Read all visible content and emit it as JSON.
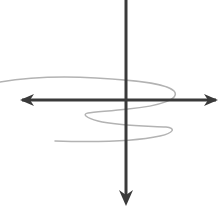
{
  "figure": {
    "kind": "coordinate-axes-with-spiral-sketch",
    "title": "",
    "caption": "",
    "background_color": "#ffffff",
    "width": 224,
    "height": 209
  },
  "axes": {
    "color": "#3a3a3a",
    "stroke_width": 3,
    "origin": {
      "x": 126,
      "y": 100
    },
    "horizontal": {
      "name": "horizontal-axis",
      "label": "",
      "x_start": 22,
      "x_end": 216,
      "y": 100,
      "arrow_left": true,
      "arrow_right": true,
      "left_arrow_tip": {
        "x": 20,
        "y": 100
      },
      "right_arrow_tip": {
        "x": 218,
        "y": 100
      }
    },
    "vertical": {
      "name": "vertical-axis",
      "label": "",
      "x": 126,
      "y_start": 0,
      "y_end": 196,
      "arrow_up": false,
      "arrow_down": true,
      "top_clipped": true,
      "bottom_arrow_tip": {
        "x": 126,
        "y": 206
      }
    }
  },
  "curve": {
    "name": "spiral-curve",
    "label": "",
    "color": "#b3b3b3",
    "stroke_width": 1.5,
    "turns": 2.5,
    "description": "Light gray hand-drawn spiral winding clockwise downward, entering from the left edge above the horizontal axis and fading out at the lower left.",
    "path": "M 0 82 C 30 77 62 76 96 78 C 132 80 166 83 174 91 C 181 99 160 106 128 109 C 110 111 94 112 88 113 C 82 114 86 118 98 121 C 118 126 150 126 166 127 C 176 128 174 133 160 136 C 132 142 86 142 55 141",
    "extrema": {
      "entry_point": {
        "x": 0,
        "y": 82
      },
      "right_apex_upper": {
        "x": 174,
        "y": 91
      },
      "left_turn_middle": {
        "x": 88,
        "y": 113
      },
      "right_apex_lower": {
        "x": 168,
        "y": 128
      },
      "exit_point": {
        "x": 55,
        "y": 141
      }
    }
  },
  "annotations": [],
  "tick_labels": [],
  "legend": {
    "visible": false,
    "entries": []
  }
}
